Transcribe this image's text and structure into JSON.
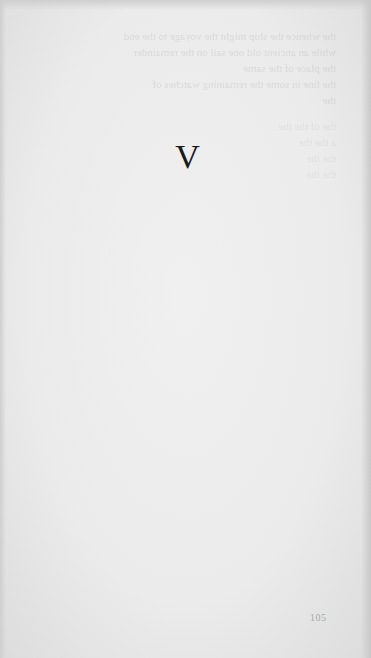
{
  "page": {
    "chapter_heading": "V",
    "page_number": "105",
    "colors": {
      "paper": "#ebebeb",
      "ink": "#1a1a1a"
    }
  },
  "bleed_through": {
    "upper_lines": [
      "the  whence  the  ship  might  the  voyage  to  the  end",
      "while  an  ancient  old  one  sail  on  the  remainder",
      "the  place  of  the  same",
      "the  line  in  some    the  remaining  watches  of",
      "the"
    ],
    "lower_lines": [
      "the        of  the              the          .",
      "a          the                    the",
      "the                                      the",
      "the                the"
    ]
  }
}
